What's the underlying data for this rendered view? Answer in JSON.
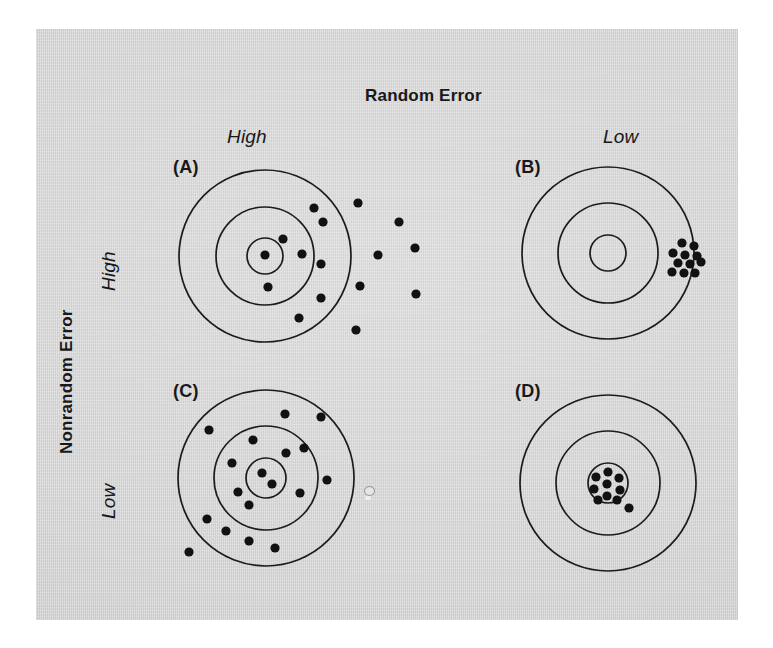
{
  "figure": {
    "column_axis_title": "Random Error",
    "row_axis_title": "Nonrandom Error",
    "column_headers": [
      {
        "label": "High"
      },
      {
        "label": "Low"
      }
    ],
    "row_headers": [
      {
        "label": "High"
      },
      {
        "label": "Low"
      }
    ],
    "background_color": "#d4d4d4",
    "ink_color": "#18181a",
    "page_color": "#ffffff"
  },
  "panels": [
    {
      "tag": "(A)",
      "column": "High",
      "row": "High",
      "description": "High random error and high nonrandom error: shots widely scattered and biased to the right of the bullseye.",
      "center": {
        "x": 265,
        "y": 256
      },
      "ring_radii": [
        18,
        49,
        86
      ],
      "shot_radius": 4.6,
      "shots": [
        {
          "x": 265,
          "y": 255
        },
        {
          "x": 283,
          "y": 239
        },
        {
          "x": 302,
          "y": 254
        },
        {
          "x": 268,
          "y": 287
        },
        {
          "x": 314,
          "y": 208
        },
        {
          "x": 323,
          "y": 222
        },
        {
          "x": 321,
          "y": 264
        },
        {
          "x": 321,
          "y": 298
        },
        {
          "x": 299,
          "y": 318
        },
        {
          "x": 358,
          "y": 203
        },
        {
          "x": 399,
          "y": 222
        },
        {
          "x": 378,
          "y": 255
        },
        {
          "x": 416,
          "y": 294
        },
        {
          "x": 415,
          "y": 248
        },
        {
          "x": 356,
          "y": 330
        },
        {
          "x": 360,
          "y": 286
        }
      ]
    },
    {
      "tag": "(B)",
      "column": "Low",
      "row": "High",
      "description": "Low random error and high nonrandom error: shots tightly clustered but far off-center at the right edge.",
      "center": {
        "x": 608,
        "y": 253
      },
      "ring_radii": [
        18,
        50,
        86
      ],
      "shot_radius": 4.6,
      "shots": [
        {
          "x": 682,
          "y": 243
        },
        {
          "x": 694,
          "y": 246
        },
        {
          "x": 673,
          "y": 253
        },
        {
          "x": 685,
          "y": 255
        },
        {
          "x": 697,
          "y": 256
        },
        {
          "x": 678,
          "y": 263
        },
        {
          "x": 690,
          "y": 264
        },
        {
          "x": 701,
          "y": 262
        },
        {
          "x": 672,
          "y": 272
        },
        {
          "x": 684,
          "y": 273
        },
        {
          "x": 695,
          "y": 273
        }
      ]
    },
    {
      "tag": "(C)",
      "column": "High",
      "row": "Low",
      "description": "High random error and low nonrandom error: shots widely scattered but centered on the bullseye.",
      "center": {
        "x": 266,
        "y": 478
      },
      "ring_radii": [
        20,
        52,
        88
      ],
      "shot_radius": 4.6,
      "shots": [
        {
          "x": 262,
          "y": 473
        },
        {
          "x": 272,
          "y": 484
        },
        {
          "x": 286,
          "y": 453
        },
        {
          "x": 232,
          "y": 463
        },
        {
          "x": 238,
          "y": 492
        },
        {
          "x": 249,
          "y": 505
        },
        {
          "x": 300,
          "y": 493
        },
        {
          "x": 253,
          "y": 440
        },
        {
          "x": 285,
          "y": 414
        },
        {
          "x": 321,
          "y": 417
        },
        {
          "x": 209,
          "y": 430
        },
        {
          "x": 304,
          "y": 448
        },
        {
          "x": 327,
          "y": 480
        },
        {
          "x": 207,
          "y": 519
        },
        {
          "x": 226,
          "y": 531
        },
        {
          "x": 249,
          "y": 541
        },
        {
          "x": 275,
          "y": 548
        },
        {
          "x": 189,
          "y": 552
        }
      ]
    },
    {
      "tag": "(D)",
      "column": "Low",
      "row": "Low",
      "description": "Low random error and low nonrandom error: shots tightly clustered on the bullseye.",
      "center": {
        "x": 608,
        "y": 483
      },
      "ring_radii": [
        20,
        52,
        88
      ],
      "shot_radius": 4.6,
      "shots": [
        {
          "x": 608,
          "y": 472
        },
        {
          "x": 596,
          "y": 477
        },
        {
          "x": 619,
          "y": 478
        },
        {
          "x": 607,
          "y": 484
        },
        {
          "x": 594,
          "y": 489
        },
        {
          "x": 620,
          "y": 490
        },
        {
          "x": 607,
          "y": 496
        },
        {
          "x": 598,
          "y": 500
        },
        {
          "x": 617,
          "y": 500
        },
        {
          "x": 629,
          "y": 508
        }
      ]
    }
  ],
  "artifacts": [
    {
      "name": "scan-speck",
      "x": 364,
      "y": 486
    }
  ]
}
